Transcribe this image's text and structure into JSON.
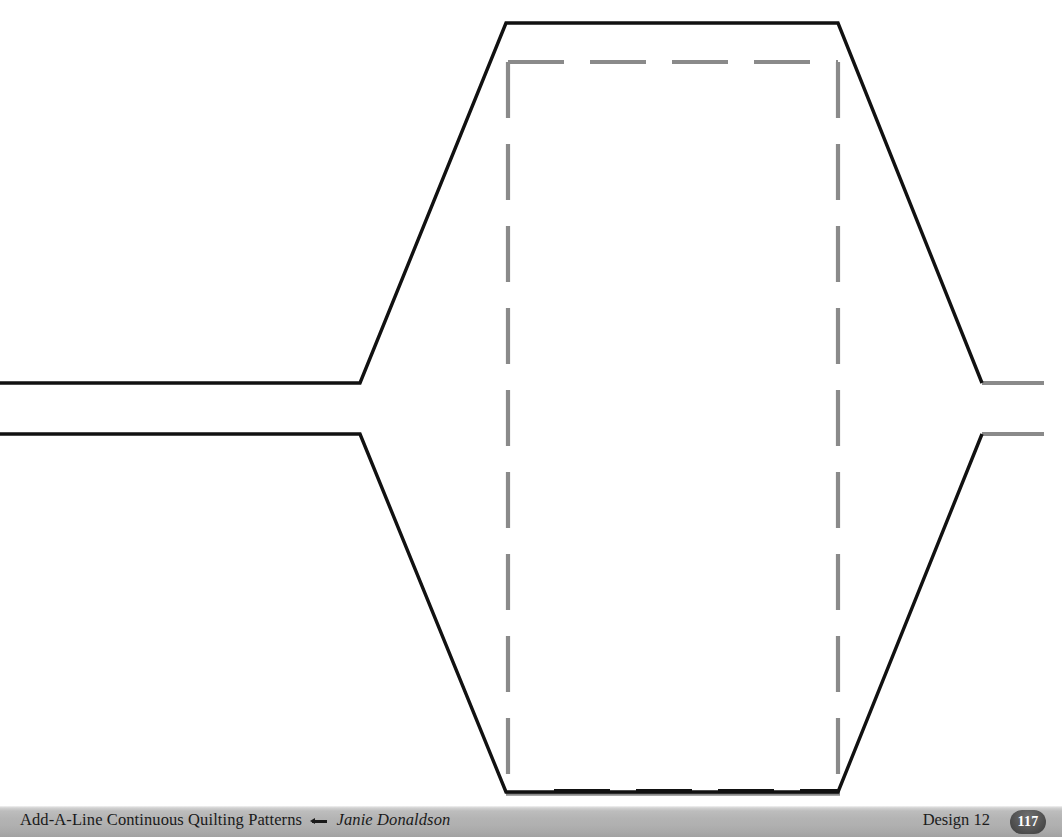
{
  "page": {
    "width": 1062,
    "height": 837,
    "background": "#ffffff"
  },
  "footer": {
    "book_title": "Add-A-Line Continuous Quilting Patterns",
    "separator_icon": "arrow-left-dash-icon",
    "author": "Janie Donaldson",
    "design_label": "Design 12",
    "page_number": "117",
    "bar_color": "#b0b0b0",
    "badge_color": "#4a4a4a",
    "text_color": "#1a1a1a"
  },
  "pattern": {
    "title": "Design 12",
    "stroke_color_primary": "#111111",
    "stroke_color_secondary": "#8a8a8a",
    "stroke_width_primary": 3.4,
    "stroke_width_secondary": 4.2,
    "dash_pattern": "56 26",
    "description": "Two parallel continuous quilting lines forming a flat-topped trapezoidal hump, with a dashed grey add-a-line guide rectangle.",
    "upper_line_points": "0,383 360,383 506,23 838,23 982,383",
    "upper_tail_points": "982,383 1044,383",
    "lower_line_points": "0,434 360,434 506,792 838,792 982,434",
    "lower_tail_points": "982,434 1044,434",
    "guide_rect": {
      "x": 508,
      "y": 62,
      "width": 330,
      "height": 730
    }
  }
}
